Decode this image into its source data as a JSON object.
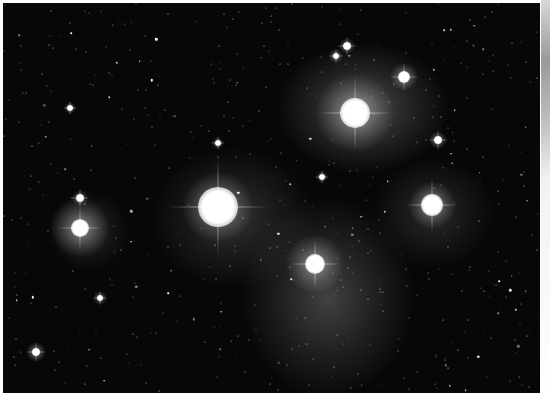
{
  "image": {
    "subject": "Open star cluster with blue reflection nebulosity (Pleiades)",
    "palette": {
      "sky": "#070707",
      "nebula": "#8a8a8a",
      "star": "#ffffff",
      "border": "#ffffff"
    },
    "bright_stars": [
      {
        "name": "star-center-large",
        "x": 218,
        "y": 207,
        "r": 20,
        "halo": 36
      },
      {
        "name": "star-upper-right",
        "x": 355,
        "y": 113,
        "r": 15,
        "halo": 40
      },
      {
        "name": "star-right",
        "x": 432,
        "y": 205,
        "r": 11,
        "halo": 24
      },
      {
        "name": "star-left",
        "x": 80,
        "y": 228,
        "r": 9,
        "halo": 30
      },
      {
        "name": "star-lower-center",
        "x": 315,
        "y": 264,
        "r": 10,
        "halo": 30
      },
      {
        "name": "star-top-right",
        "x": 404,
        "y": 77,
        "r": 6,
        "halo": 14
      },
      {
        "name": "star-top-pair-a",
        "x": 347,
        "y": 46,
        "r": 4,
        "halo": 8
      },
      {
        "name": "star-top-pair-b",
        "x": 336,
        "y": 56,
        "r": 3,
        "halo": 7
      },
      {
        "name": "star-right-mid",
        "x": 438,
        "y": 140,
        "r": 4,
        "halo": 9
      },
      {
        "name": "star-left-upper",
        "x": 80,
        "y": 198,
        "r": 4,
        "halo": 8
      },
      {
        "name": "star-bottom-left",
        "x": 36,
        "y": 352,
        "r": 4,
        "halo": 10
      },
      {
        "name": "star-lower-left",
        "x": 100,
        "y": 298,
        "r": 3,
        "halo": 7
      },
      {
        "name": "star-center-top",
        "x": 218,
        "y": 143,
        "r": 3,
        "halo": 6
      },
      {
        "name": "star-mid",
        "x": 322,
        "y": 177,
        "r": 3,
        "halo": 6
      },
      {
        "name": "star-left-top",
        "x": 70,
        "y": 108,
        "r": 3,
        "halo": 6
      }
    ],
    "nebulae": [
      {
        "name": "nebula-upper-right",
        "x": 360,
        "y": 105,
        "w": 170,
        "h": 130,
        "opacity": 0.35
      },
      {
        "name": "nebula-lower-center",
        "x": 325,
        "y": 295,
        "w": 170,
        "h": 200,
        "opacity": 0.3
      },
      {
        "name": "nebula-center",
        "x": 230,
        "y": 215,
        "w": 160,
        "h": 140,
        "opacity": 0.22
      },
      {
        "name": "nebula-right",
        "x": 430,
        "y": 210,
        "w": 120,
        "h": 110,
        "opacity": 0.18
      },
      {
        "name": "nebula-left",
        "x": 85,
        "y": 228,
        "w": 80,
        "h": 80,
        "opacity": 0.18
      }
    ]
  }
}
